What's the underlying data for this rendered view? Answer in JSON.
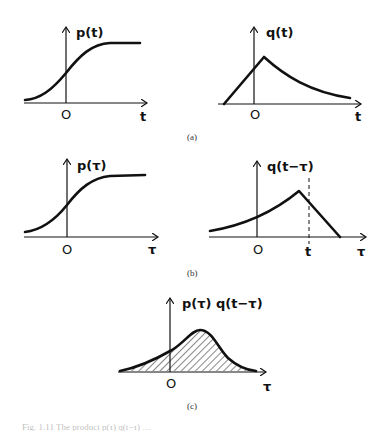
{
  "figure": {
    "panels": [
      {
        "id": "a-left",
        "ylabel": "p(t)",
        "origin_label": "O",
        "xlabel": "t",
        "curve": "sigmoid"
      },
      {
        "id": "a-right",
        "ylabel": "q(t)",
        "origin_label": "O",
        "xlabel": "t",
        "curve": "linear rise to peak just right of origin, then exponential decay"
      },
      {
        "id": "b-left",
        "ylabel": "p(τ)",
        "origin_label": "O",
        "xlabel": "τ",
        "curve": "sigmoid"
      },
      {
        "id": "b-right",
        "ylabel": "q(t−τ)",
        "origin_label": "O",
        "marker_label": "t",
        "xlabel": "τ",
        "curve": "mirrored q: exponential rise to peak just left of t, then linear fall; dashed vertical line at t"
      },
      {
        "id": "c",
        "ylabel": "p(τ) q(t−τ)",
        "origin_label": "O",
        "xlabel": "τ",
        "curve": "bell-shaped product, area hatched"
      }
    ],
    "sublabels": {
      "a": "(a)",
      "b": "(b)",
      "c": "(c)"
    },
    "caption_partial": "Fig. 1.11  The product p(τ) q(t−τ) …"
  }
}
